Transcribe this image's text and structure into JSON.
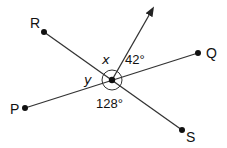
{
  "diagram": {
    "type": "intersecting lines with angle labels",
    "points": {
      "R": {
        "label": "R",
        "x": 44,
        "y": 32
      },
      "Q": {
        "label": "Q",
        "x": 198,
        "y": 53
      },
      "P": {
        "label": "P",
        "x": 25,
        "y": 108
      },
      "S": {
        "label": "S",
        "x": 182,
        "y": 130
      },
      "center": {
        "x": 112,
        "y": 80
      }
    },
    "ray": {
      "tip_x": 154,
      "tip_y": 7
    },
    "angles": {
      "x": "x",
      "y": "y",
      "a42": "42°",
      "a128": "128°"
    },
    "colors": {
      "stroke": "#222222",
      "background": "#ffffff"
    }
  }
}
